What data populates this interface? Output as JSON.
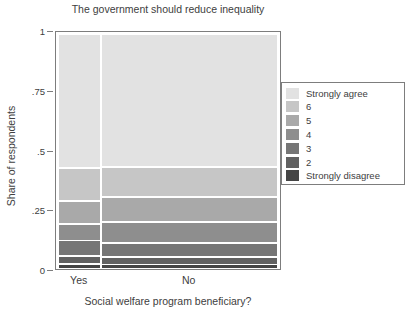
{
  "chart_data": {
    "type": "bar",
    "title": "The government should reduce inequality",
    "subtitle": "",
    "xlabel": "Social welfare program beneficiary?",
    "ylabel": "Share of respondents",
    "ylim": [
      0,
      1
    ],
    "xlim": [
      0,
      1
    ],
    "grid": false,
    "legend_position": "right",
    "categories": [
      "Yes",
      "No"
    ],
    "category_widths": [
      0.197,
      0.803
    ],
    "series": [
      {
        "name": "Strongly agree",
        "color": "#e2e2e2",
        "values": [
          0.575,
          0.57
        ]
      },
      {
        "name": "6",
        "color": "#c6c6c6",
        "values": [
          0.14,
          0.13
        ]
      },
      {
        "name": "5",
        "color": "#a9a9a9",
        "values": [
          0.1,
          0.105
        ]
      },
      {
        "name": "4",
        "color": "#8e8e8e",
        "values": [
          0.07,
          0.09
        ]
      },
      {
        "name": "3",
        "color": "#767676",
        "values": [
          0.067,
          0.06
        ]
      },
      {
        "name": "2",
        "color": "#616161",
        "values": [
          0.033,
          0.033
        ]
      },
      {
        "name": "Strongly disagree",
        "color": "#454545",
        "values": [
          0.015,
          0.012
        ]
      }
    ],
    "yticks": [
      "0",
      ".25",
      ".5",
      ".75",
      "1"
    ],
    "ytick_values": [
      0,
      0.25,
      0.5,
      0.75,
      1
    ],
    "xticks": [
      "Yes",
      "No"
    ]
  },
  "legend": {
    "entries": [
      {
        "label": "Strongly agree",
        "color": "#e2e2e2"
      },
      {
        "label": "6",
        "color": "#c6c6c6"
      },
      {
        "label": "5",
        "color": "#a9a9a9"
      },
      {
        "label": "4",
        "color": "#8e8e8e"
      },
      {
        "label": "3",
        "color": "#767676"
      },
      {
        "label": "2",
        "color": "#616161"
      },
      {
        "label": "Strongly disagree",
        "color": "#454545"
      }
    ]
  },
  "colors": {
    "frame": "#7d7d7d",
    "text": "#404040",
    "background": "#ffffff",
    "gap": "#ffffff"
  }
}
